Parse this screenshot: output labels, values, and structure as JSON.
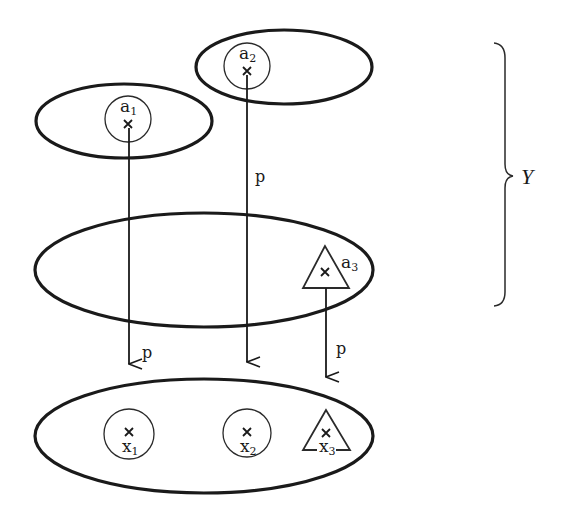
{
  "diagram": {
    "brace_label": "Y",
    "map_label": "p",
    "points_top": [
      {
        "name": "a",
        "sub": "1",
        "marker": "circle"
      },
      {
        "name": "a",
        "sub": "2",
        "marker": "circle"
      },
      {
        "name": "a",
        "sub": "3",
        "marker": "triangle"
      }
    ],
    "points_base": [
      {
        "name": "x",
        "sub": "1",
        "marker": "circle"
      },
      {
        "name": "x",
        "sub": "2",
        "marker": "circle"
      },
      {
        "name": "x",
        "sub": "3",
        "marker": "triangle"
      }
    ],
    "arrows": [
      {
        "from": "a1",
        "to": "x1",
        "label": "p"
      },
      {
        "from": "a2",
        "to": "x2",
        "label": "p"
      },
      {
        "from": "a3",
        "to": "x3",
        "label": "p"
      }
    ],
    "colors": {
      "stroke": "#1a1a1a",
      "background": "#ffffff"
    }
  }
}
